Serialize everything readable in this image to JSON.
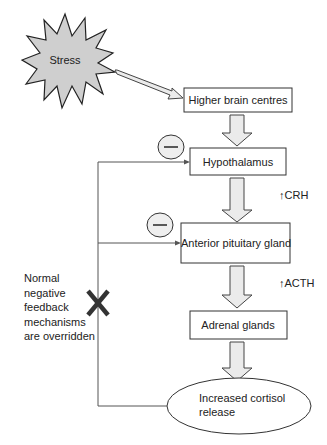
{
  "diagram": {
    "stimulus": {
      "label": "Stress",
      "fill": "#cfcfcf"
    },
    "nodes": [
      {
        "id": "higher-brain-centres",
        "label": "Higher brain centres"
      },
      {
        "id": "hypothalamus",
        "label": "Hypothalamus"
      },
      {
        "id": "anterior-pituitary-gland",
        "label": "Anterior pituitary gland"
      },
      {
        "id": "adrenal-glands",
        "label": "Adrenal glands"
      },
      {
        "id": "increased-cortisol-release",
        "label_line1": "Increased cortisol",
        "label_line2": "release"
      }
    ],
    "hormones": [
      {
        "label": "↑CRH"
      },
      {
        "label": "↑ACTH"
      }
    ],
    "inhibition_symbol": "—",
    "feedback_note": [
      "Normal",
      "negative",
      "feedback",
      "mechanisms",
      "are overridden"
    ],
    "colors": {
      "arrow_fill": "#ebebeb",
      "line": "#555555",
      "cross": "#333333"
    }
  }
}
